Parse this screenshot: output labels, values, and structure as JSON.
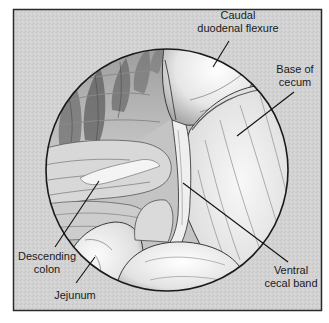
{
  "figure": {
    "type": "anatomical-illustration",
    "view": "circular endoscopic / surgical field view",
    "colors": {
      "background": "#ffffff",
      "frame_fill": "#d4d4d4",
      "frame_border": "#2a2a2a",
      "circle_outline": "#1a1a1a",
      "tissue_light": "#f2f2f2",
      "tissue_mid": "#bdbdbd",
      "tissue_dark": "#6e6e6e",
      "leader_line": "#111111",
      "label_text": "#1a1a1a"
    },
    "labels": {
      "caudal_duodenal_flexure": {
        "line1": "Caudal",
        "line2": "duodenal flexure"
      },
      "base_of_cecum": {
        "line1": "Base of",
        "line2": "cecum"
      },
      "descending_colon": {
        "line1": "Descending",
        "line2": "colon"
      },
      "jejunum": {
        "line1": "Jejunum"
      },
      "ventral_cecal_band": {
        "line1": "Ventral",
        "line2": "cecal band"
      }
    }
  }
}
